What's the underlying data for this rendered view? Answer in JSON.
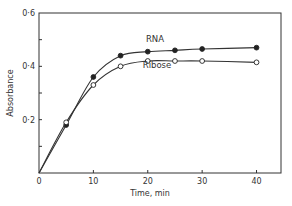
{
  "chart_data": {
    "type": "line",
    "title": "",
    "xlabel": "Time, min",
    "ylabel": "Absorbance",
    "xlim": [
      0,
      44.5
    ],
    "ylim": [
      0,
      0.6
    ],
    "x_ticks": [
      0,
      10,
      20,
      30,
      40
    ],
    "x_tick_labels": [
      "0",
      "10",
      "20",
      "30",
      "40"
    ],
    "y_ticks": [
      0,
      0.1,
      0.2,
      0.3,
      0.4,
      0.5,
      0.6
    ],
    "y_tick_labels": [
      "",
      "",
      "0·2",
      "",
      "0·4",
      "",
      "0·6"
    ],
    "origin_label": "0",
    "grid": false,
    "legend": "inline labels",
    "series": [
      {
        "name": "RNA",
        "marker": "filled-circle",
        "x": [
          0,
          5,
          10,
          15,
          20,
          25,
          30,
          40
        ],
        "values": [
          0,
          0.18,
          0.36,
          0.44,
          0.455,
          0.46,
          0.465,
          0.47
        ]
      },
      {
        "name": "Ribose",
        "marker": "open-circle",
        "x": [
          0,
          5,
          10,
          15,
          20,
          25,
          30,
          40
        ],
        "values": [
          0,
          0.19,
          0.33,
          0.4,
          0.42,
          0.42,
          0.42,
          0.415
        ]
      }
    ]
  }
}
